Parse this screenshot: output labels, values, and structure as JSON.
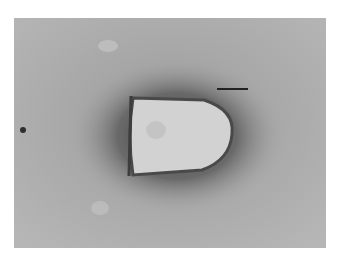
{
  "figure": {
    "type": "electron-micrograph",
    "colors": {
      "background_gray": "#a9a9a9",
      "halo_dark": "#5a5a5a",
      "particle_light": "#d4d4d4",
      "scale_bar": "#222222",
      "page": "#ffffff"
    },
    "scale_bar": {
      "x": 217,
      "y": 88,
      "length_px": 31,
      "label": ""
    },
    "particle": {
      "x_base": 133,
      "x_tip": 232,
      "y_top": 98,
      "y_bottom": 175
    },
    "artifact_dot": {
      "x": 23,
      "y": 130
    }
  }
}
